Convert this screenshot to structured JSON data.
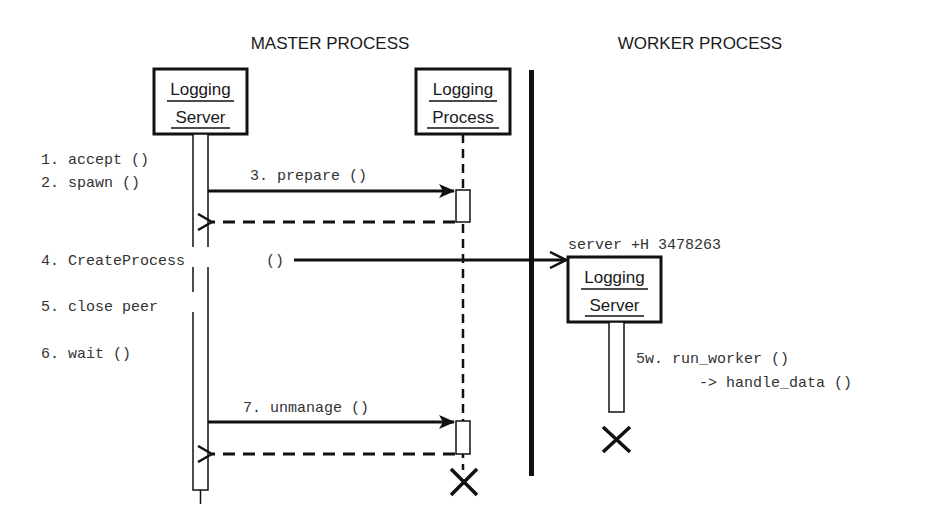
{
  "diagram": {
    "type": "sequence",
    "titles": {
      "master": "MASTER PROCESS",
      "worker": "WORKER PROCESS"
    },
    "participants": [
      {
        "id": "master-logging-server",
        "line1": "Logging",
        "line2": "Server",
        "side": "master"
      },
      {
        "id": "logging-process",
        "line1": "Logging",
        "line2": "Process",
        "side": "master"
      },
      {
        "id": "worker-logging-server",
        "line1": "Logging",
        "line2": "Server",
        "side": "worker"
      }
    ],
    "steps": {
      "s1": "1. accept ()",
      "s2": "2. spawn ()",
      "s3": "3. prepare ()",
      "s4a": "4. CreateProcess",
      "s4b": "()",
      "s5": "5. close peer",
      "s6": "6. wait ()",
      "s7": "7. unmanage ()",
      "s5w_a": "5w. run_worker ()",
      "s5w_b": "-> handle_data ()"
    },
    "worker_command": "server +H 3478263",
    "colors": {
      "ink": "#111111",
      "text": "#333333",
      "background": "#ffffff"
    }
  }
}
